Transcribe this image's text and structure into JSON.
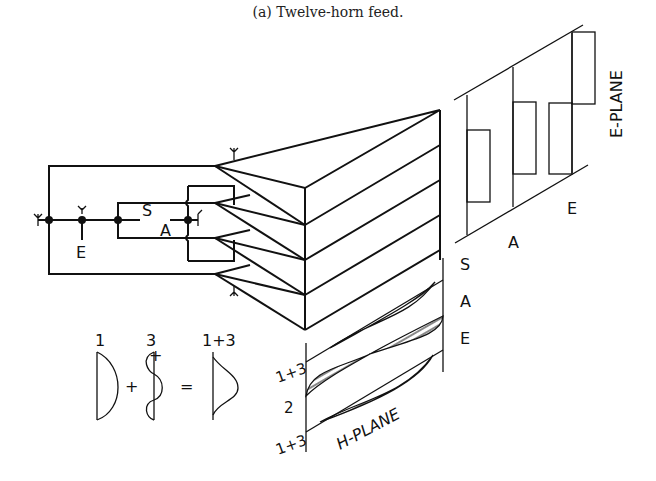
{
  "caption": "(a)  Twelve-horn feed.",
  "network": {
    "labels": {
      "S": "S",
      "A": "A",
      "E": "E"
    }
  },
  "e_plane": {
    "title": "E-PLANE",
    "labels": [
      "A",
      "E"
    ]
  },
  "h_plane": {
    "title": "H-PLANE",
    "mode_labels_right": [
      "S",
      "A",
      "E"
    ],
    "row_labels_left": [
      "1+3",
      "2",
      "1+3"
    ]
  },
  "mode_sum": {
    "term1": "1",
    "term2": "3",
    "result": "1+3",
    "plus": "+",
    "equals": "="
  }
}
